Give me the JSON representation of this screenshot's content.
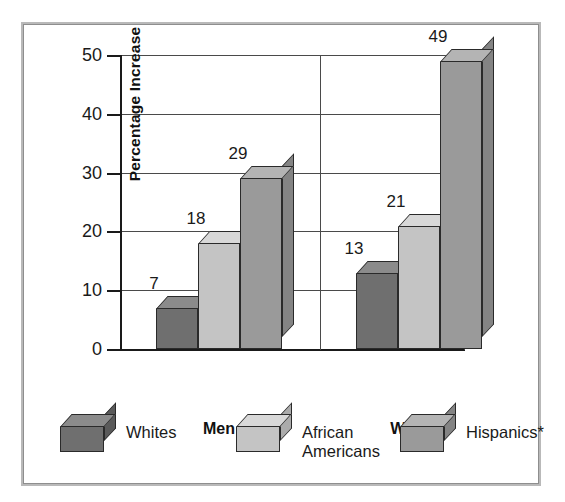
{
  "chart_data": {
    "type": "bar",
    "title": "",
    "subtitle": "",
    "xlabel": "",
    "ylabel": "Percentage Increase",
    "ylim": [
      0,
      50
    ],
    "yticks": [
      0,
      10,
      20,
      30,
      40,
      50
    ],
    "ytick_labels": [
      "0",
      "10",
      "20",
      "30",
      "40",
      "50"
    ],
    "grid": true,
    "grid_axis": "y",
    "legend_position": "bottom",
    "style": "3d-column",
    "categories": [
      "Men",
      "Women"
    ],
    "series": [
      {
        "name": "Whites",
        "values": [
          7,
          13
        ],
        "color": "#6f6f6f"
      },
      {
        "name": "African Americans",
        "values": [
          18,
          21
        ],
        "color": "#c4c4c4"
      },
      {
        "name": "Hispanics*",
        "values": [
          29,
          49
        ],
        "color": "#9a9a9a"
      }
    ],
    "data_labels": [
      "7",
      "18",
      "29",
      "13",
      "21",
      "49"
    ],
    "footnote": "*"
  },
  "axis": {
    "y_title": "Percentage Increase",
    "ticks": [
      {
        "label": "50",
        "value": 50
      },
      {
        "label": "40",
        "value": 40
      },
      {
        "label": "30",
        "value": 30
      },
      {
        "label": "20",
        "value": 20
      },
      {
        "label": "10",
        "value": 10
      },
      {
        "label": "0",
        "value": 0
      }
    ]
  },
  "groups": [
    {
      "label": "Men",
      "bars": [
        {
          "series": "Whites",
          "value": 7,
          "label": "7",
          "tone": "c-dark"
        },
        {
          "series": "African Americans",
          "value": 18,
          "label": "18",
          "tone": "c-light"
        },
        {
          "series": "Hispanics*",
          "value": 29,
          "label": "29",
          "tone": "c-mid"
        }
      ]
    },
    {
      "label": "Women",
      "bars": [
        {
          "series": "Whites",
          "value": 13,
          "label": "13",
          "tone": "c-dark"
        },
        {
          "series": "African Americans",
          "value": 21,
          "label": "21",
          "tone": "c-light"
        },
        {
          "series": "Hispanics*",
          "value": 49,
          "label": "49",
          "tone": "c-mid"
        }
      ]
    }
  ],
  "legend": {
    "items": [
      {
        "label": "Whites",
        "tone": "c-dark"
      },
      {
        "label": "African\nAmericans",
        "tone": "c-light"
      },
      {
        "label": "Hispanics*",
        "tone": "c-mid"
      }
    ]
  },
  "colors": {
    "whites": "#6f6f6f",
    "african_americans": "#c4c4c4",
    "hispanics": "#9a9a9a",
    "frame": "#8e8e8e",
    "axis": "#1a1a1a",
    "grid": "#4a4a4a",
    "background": "#ffffff"
  }
}
